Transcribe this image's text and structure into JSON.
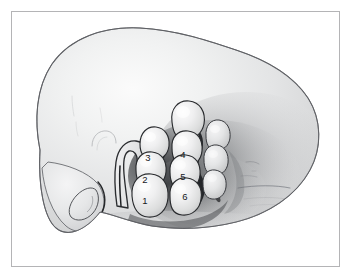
{
  "figure": {
    "medium": "pencil and wash line drawing",
    "orientation": "lateral profile facing right",
    "frame": {
      "border_color": "#b4b4b6",
      "background_color": "#ffffff",
      "inset_px": 11
    },
    "palette": {
      "outline": "#3a3c40",
      "deep_shadow": "#1d1f22",
      "mid_tone": "#c9cacb",
      "light_tone": "#e8e9ea",
      "highlight": "#f6f6f6",
      "number_color": "#15181c",
      "paper": "#ffffff"
    }
  },
  "labels": {
    "hillocks": [
      {
        "id": "1",
        "text": "1",
        "column": "anterior",
        "position": "bottom"
      },
      {
        "id": "2",
        "text": "2",
        "column": "anterior",
        "position": "middle"
      },
      {
        "id": "3",
        "text": "3",
        "column": "anterior",
        "position": "top"
      },
      {
        "id": "4",
        "text": "4",
        "column": "posterior",
        "position": "top"
      },
      {
        "id": "5",
        "text": "5",
        "column": "posterior",
        "position": "middle"
      },
      {
        "id": "6",
        "text": "6",
        "column": "posterior",
        "position": "bottom"
      }
    ]
  },
  "regions": [
    {
      "name": "cranial-vault",
      "description": "large smooth rounded cranium occupying upper and left area"
    },
    {
      "name": "mandibular-lobe",
      "description": "lower-left rounded lobe with oval internal detail"
    },
    {
      "name": "mandibular-oval-detail",
      "description": "teardrop shaped internal contour in lower-left lobe"
    },
    {
      "name": "hook-structure",
      "description": "J shaped curved hook anterior to the hillock cluster"
    },
    {
      "name": "faint-arc",
      "description": "light pencil arc left of the hook structure"
    },
    {
      "name": "hillock-column-anterior",
      "description": "vertical chain of three lobes labeled 3, 2, 1"
    },
    {
      "name": "hillock-column-posterior",
      "description": "vertical chain of three lobes labeled 4, 5, 6"
    },
    {
      "name": "hillock-column-lateral",
      "description": "smaller third chain of lobes at the right of the cluster"
    },
    {
      "name": "cervical-shading",
      "description": "dark stippled shading fanning to the right of the cluster"
    },
    {
      "name": "hatch-lines",
      "description": "faint horizontal stroke marks in the right shaded field"
    },
    {
      "name": "lower-diagonal-edge",
      "description": "diagonal fading edge along the lower boundary"
    }
  ]
}
